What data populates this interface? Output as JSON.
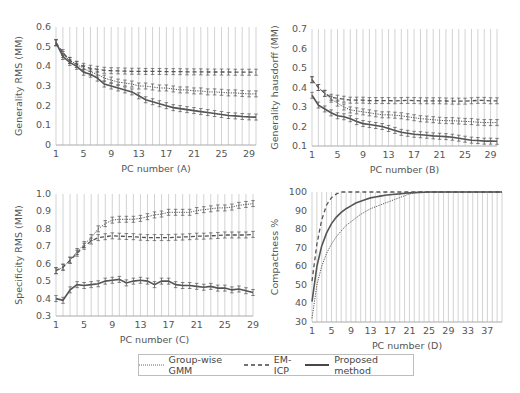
{
  "chart_data": [
    {
      "id": "A",
      "type": "line",
      "title": "",
      "xlabel": "PC number (A)",
      "ylabel": "Generality RMS (MM)",
      "xlim": [
        1,
        30
      ],
      "ylim": [
        0,
        0.6
      ],
      "yticks": [
        0,
        0.1,
        0.2,
        0.3,
        0.4,
        0.5,
        0.6
      ],
      "ytick_labels": [
        "0",
        "0.1",
        "0.2",
        "0.3",
        "0.4",
        "0.5",
        "0.6"
      ],
      "xticks": [
        1,
        5,
        9,
        13,
        17,
        21,
        25,
        29
      ],
      "grid": "vertical",
      "error_bars": true,
      "x": [
        1,
        2,
        3,
        4,
        5,
        6,
        7,
        8,
        9,
        10,
        11,
        12,
        13,
        14,
        15,
        16,
        17,
        18,
        19,
        20,
        21,
        22,
        23,
        24,
        25,
        26,
        27,
        28,
        29,
        30
      ],
      "series": [
        {
          "name": "EM-ICP",
          "style": "dashed",
          "values": [
            0.52,
            0.47,
            0.43,
            0.41,
            0.4,
            0.39,
            0.385,
            0.38,
            0.378,
            0.377,
            0.376,
            0.375,
            0.375,
            0.374,
            0.374,
            0.374,
            0.373,
            0.373,
            0.373,
            0.372,
            0.372,
            0.372,
            0.371,
            0.371,
            0.371,
            0.371,
            0.37,
            0.37,
            0.37,
            0.37
          ]
        },
        {
          "name": "Group-wise GMM",
          "style": "dotted",
          "values": [
            0.52,
            0.46,
            0.43,
            0.41,
            0.39,
            0.37,
            0.36,
            0.34,
            0.33,
            0.32,
            0.315,
            0.31,
            0.3,
            0.3,
            0.295,
            0.29,
            0.29,
            0.285,
            0.28,
            0.28,
            0.275,
            0.275,
            0.27,
            0.27,
            0.268,
            0.265,
            0.265,
            0.262,
            0.26,
            0.26
          ]
        },
        {
          "name": "Proposed method",
          "style": "solid",
          "values": [
            0.52,
            0.45,
            0.42,
            0.4,
            0.37,
            0.36,
            0.34,
            0.31,
            0.3,
            0.29,
            0.28,
            0.27,
            0.25,
            0.23,
            0.22,
            0.21,
            0.2,
            0.19,
            0.185,
            0.18,
            0.175,
            0.17,
            0.165,
            0.16,
            0.155,
            0.15,
            0.148,
            0.145,
            0.143,
            0.142
          ]
        }
      ]
    },
    {
      "id": "B",
      "type": "line",
      "title": "",
      "xlabel": "PC number (B)",
      "ylabel": "Generality hausdorff (MM)",
      "xlim": [
        1,
        30
      ],
      "ylim": [
        0.1,
        0.7
      ],
      "yticks": [
        0.1,
        0.2,
        0.3,
        0.4,
        0.5,
        0.6,
        0.7
      ],
      "ytick_labels": [
        "0.1",
        "0.2",
        "0.3",
        "0.4",
        "0.5",
        "0.6",
        "0.7"
      ],
      "xticks": [
        1,
        5,
        9,
        13,
        17,
        21,
        25,
        29
      ],
      "grid": "vertical",
      "error_bars": true,
      "x": [
        1,
        2,
        3,
        4,
        5,
        6,
        7,
        8,
        9,
        10,
        11,
        12,
        13,
        14,
        15,
        16,
        17,
        18,
        19,
        20,
        21,
        22,
        23,
        24,
        25,
        26,
        27,
        28,
        29,
        30
      ],
      "series": [
        {
          "name": "EM-ICP",
          "style": "dashed",
          "values": [
            0.44,
            0.4,
            0.37,
            0.35,
            0.345,
            0.34,
            0.335,
            0.335,
            0.335,
            0.333,
            0.333,
            0.333,
            0.333,
            0.332,
            0.333,
            0.334,
            0.333,
            0.332,
            0.332,
            0.332,
            0.332,
            0.331,
            0.33,
            0.33,
            0.33,
            0.332,
            0.334,
            0.334,
            0.332,
            0.332
          ]
        },
        {
          "name": "Group-wise GMM",
          "style": "dotted",
          "values": [
            0.44,
            0.4,
            0.37,
            0.34,
            0.32,
            0.3,
            0.285,
            0.28,
            0.275,
            0.27,
            0.265,
            0.26,
            0.26,
            0.258,
            0.255,
            0.25,
            0.245,
            0.24,
            0.238,
            0.235,
            0.232,
            0.23,
            0.23,
            0.228,
            0.226,
            0.225,
            0.222,
            0.22,
            0.22,
            0.22
          ]
        },
        {
          "name": "Proposed method",
          "style": "solid",
          "values": [
            0.36,
            0.31,
            0.29,
            0.27,
            0.255,
            0.25,
            0.24,
            0.225,
            0.215,
            0.21,
            0.205,
            0.2,
            0.19,
            0.18,
            0.17,
            0.165,
            0.16,
            0.158,
            0.155,
            0.152,
            0.15,
            0.148,
            0.145,
            0.14,
            0.135,
            0.13,
            0.128,
            0.125,
            0.125,
            0.124
          ]
        }
      ]
    },
    {
      "id": "C",
      "type": "line",
      "title": "",
      "xlabel": "PC number (C)",
      "ylabel": "Specificity RMS (MM)",
      "xlim": [
        1,
        29
      ],
      "ylim": [
        0.3,
        1.0
      ],
      "yticks": [
        0.3,
        0.4,
        0.5,
        0.6,
        0.7,
        0.8,
        0.9,
        1.0
      ],
      "ytick_labels": [
        "0.3",
        "0.4",
        "0.5",
        "0.6",
        "0.7",
        "0.8",
        "0.9",
        "1.0"
      ],
      "xticks": [
        1,
        5,
        9,
        13,
        17,
        21,
        25,
        29
      ],
      "grid": "vertical",
      "error_bars": true,
      "x": [
        1,
        2,
        3,
        4,
        5,
        6,
        7,
        8,
        9,
        10,
        11,
        12,
        13,
        14,
        15,
        16,
        17,
        18,
        19,
        20,
        21,
        22,
        23,
        24,
        25,
        26,
        27,
        28,
        29
      ],
      "series": [
        {
          "name": "Group-wise GMM",
          "style": "dotted",
          "values": [
            0.56,
            0.58,
            0.62,
            0.67,
            0.71,
            0.75,
            0.8,
            0.83,
            0.85,
            0.855,
            0.855,
            0.855,
            0.86,
            0.87,
            0.88,
            0.885,
            0.895,
            0.895,
            0.895,
            0.895,
            0.905,
            0.91,
            0.915,
            0.92,
            0.92,
            0.925,
            0.935,
            0.94,
            0.945
          ]
        },
        {
          "name": "EM-ICP",
          "style": "dashed",
          "values": [
            0.56,
            0.58,
            0.62,
            0.66,
            0.7,
            0.73,
            0.75,
            0.755,
            0.76,
            0.758,
            0.756,
            0.755,
            0.752,
            0.75,
            0.75,
            0.75,
            0.75,
            0.752,
            0.753,
            0.755,
            0.758,
            0.758,
            0.76,
            0.762,
            0.765,
            0.765,
            0.765,
            0.765,
            0.768
          ]
        },
        {
          "name": "Proposed method",
          "style": "solid",
          "values": [
            0.4,
            0.39,
            0.45,
            0.48,
            0.475,
            0.48,
            0.485,
            0.5,
            0.505,
            0.51,
            0.49,
            0.5,
            0.505,
            0.5,
            0.48,
            0.5,
            0.5,
            0.48,
            0.475,
            0.475,
            0.47,
            0.465,
            0.47,
            0.46,
            0.46,
            0.45,
            0.455,
            0.445,
            0.435
          ]
        }
      ]
    },
    {
      "id": "D",
      "type": "line",
      "title": "",
      "xlabel": "PC number (D)",
      "ylabel": "Compactness %",
      "xlim": [
        1,
        40
      ],
      "ylim": [
        30,
        100
      ],
      "yticks": [
        30,
        40,
        50,
        60,
        70,
        80,
        90,
        100
      ],
      "ytick_labels": [
        "30",
        "40",
        "50",
        "60",
        "70",
        "80",
        "90",
        "100"
      ],
      "xticks": [
        1,
        5,
        9,
        13,
        17,
        21,
        25,
        29,
        33,
        37
      ],
      "grid": "vertical",
      "error_bars": false,
      "x": [
        1,
        2,
        3,
        4,
        5,
        6,
        7,
        8,
        9,
        10,
        11,
        12,
        13,
        14,
        15,
        16,
        17,
        18,
        19,
        20,
        21,
        22,
        23,
        24,
        25,
        26,
        27,
        28,
        29,
        30,
        31,
        32,
        33,
        34,
        35,
        36,
        37,
        38,
        39,
        40
      ],
      "series": [
        {
          "name": "Group-wise GMM",
          "style": "dotted",
          "values": [
            32,
            50,
            60,
            67,
            72,
            76,
            79,
            82,
            84,
            86,
            88,
            89.5,
            91,
            92,
            93,
            94,
            95,
            96,
            97,
            98,
            99,
            99.5,
            100,
            100,
            100,
            100,
            100,
            100,
            100,
            100,
            100,
            100,
            100,
            100,
            100,
            100,
            100,
            100,
            100,
            100
          ]
        },
        {
          "name": "EM-ICP",
          "style": "dashed",
          "values": [
            52,
            72,
            85,
            93,
            97,
            99,
            100,
            100,
            100,
            100,
            100,
            100,
            100,
            100,
            100,
            100,
            100,
            100,
            100,
            100,
            100,
            100,
            100,
            100,
            100,
            100,
            100,
            100,
            100,
            100,
            100,
            100,
            100,
            100,
            100,
            100,
            100,
            100,
            100,
            100
          ]
        },
        {
          "name": "Proposed method",
          "style": "solid",
          "values": [
            41,
            60,
            71,
            78,
            83,
            86.5,
            89,
            91,
            92.5,
            94,
            95,
            96,
            96.8,
            97.3,
            97.8,
            98.2,
            98.5,
            98.8,
            99,
            99.3,
            99.5,
            99.7,
            99.8,
            99.9,
            100,
            100,
            100,
            100,
            100,
            100,
            100,
            100,
            100,
            100,
            100,
            100,
            100,
            100,
            100,
            100
          ]
        }
      ]
    }
  ],
  "legend": {
    "items": [
      {
        "label": "Group-wise GMM",
        "style": "dotted"
      },
      {
        "label": "EM-ICP",
        "style": "dashed"
      },
      {
        "label": "Proposed method",
        "style": "solid"
      }
    ]
  },
  "colors": {
    "line": "#555555",
    "grid": "#c8c8c8",
    "axis": "#aaaaaa",
    "text": "#555555"
  }
}
